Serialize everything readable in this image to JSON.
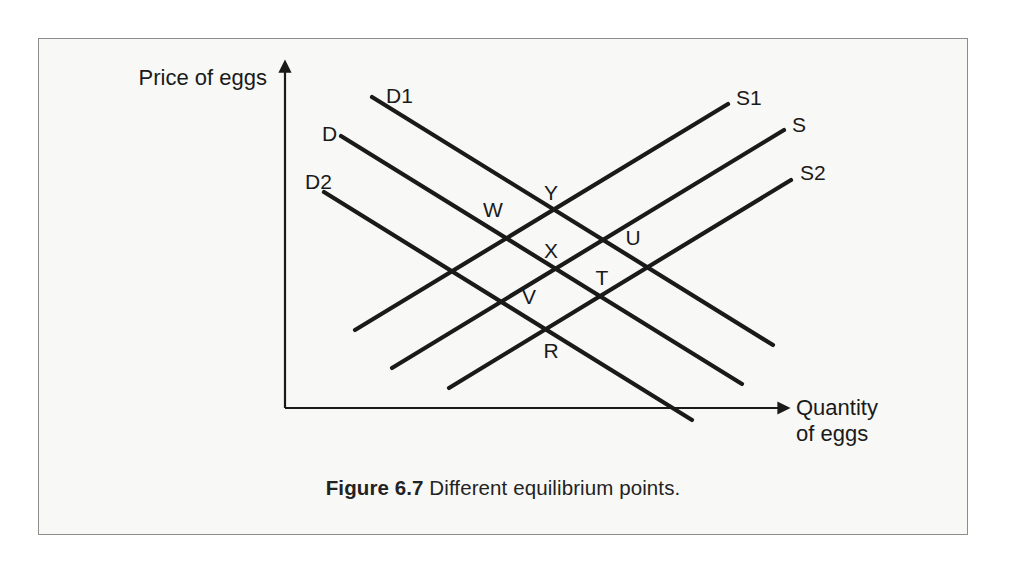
{
  "figure": {
    "caption_label": "Figure 6.7",
    "caption_text": "Different equilibrium points.",
    "frame_color": "#8d8d8d",
    "background_color": "#f8f8f6",
    "line_color": "#1a1a1a"
  },
  "axes": {
    "y_axis_label_line1": "Price of eggs",
    "x_axis_label_line1": "Quantity",
    "x_axis_label_line2": "of eggs",
    "origin": [
      285,
      408
    ],
    "y_axis_top": [
      285,
      70
    ],
    "x_axis_right": [
      780,
      408
    ]
  },
  "chart_data": {
    "type": "line",
    "title": "Different equilibrium points.",
    "xlabel": "Quantity of eggs",
    "ylabel": "Price of eggs",
    "grid": false,
    "legend": "inline-curve-labels",
    "axis_style": "arrow-headed, unscaled schematic axes (no tick marks, no numeric ticks)",
    "series": [
      {
        "name": "D1",
        "role": "demand",
        "slope": "negative",
        "label": "D1",
        "label_pos": [
          386,
          97
        ],
        "start": [
          372,
          97
        ],
        "end": [
          773,
          345
        ]
      },
      {
        "name": "D",
        "role": "demand",
        "slope": "negative",
        "label": "D",
        "label_pos": [
          322,
          135
        ],
        "start": [
          341,
          136
        ],
        "end": [
          742,
          384
        ]
      },
      {
        "name": "D2",
        "role": "demand",
        "slope": "negative",
        "label": "D2",
        "label_pos": [
          305,
          183
        ],
        "start": [
          324,
          192
        ],
        "end": [
          692,
          420
        ]
      },
      {
        "name": "S1",
        "role": "supply",
        "slope": "positive",
        "label": "S1",
        "label_pos": [
          736,
          99
        ],
        "start": [
          355,
          330
        ],
        "end": [
          728,
          104
        ]
      },
      {
        "name": "S",
        "role": "supply",
        "slope": "positive",
        "label": "S",
        "label_pos": [
          792,
          126
        ],
        "start": [
          392,
          368
        ],
        "end": [
          784,
          130
        ]
      },
      {
        "name": "S2",
        "role": "supply",
        "slope": "positive",
        "label": "S2",
        "label_pos": [
          800,
          174
        ],
        "start": [
          449,
          388
        ],
        "end": [
          791,
          180
        ]
      }
    ],
    "equilibrium_points": [
      {
        "label": "Y",
        "curves": [
          "D1",
          "S1"
        ],
        "point": [
          558,
          212
        ],
        "label_pos": [
          551,
          194
        ]
      },
      {
        "label": "W",
        "curves": [
          "D",
          "S1"
        ],
        "point": [
          500,
          248
        ],
        "label_pos": [
          493,
          211
        ]
      },
      {
        "label": "X",
        "curves": [
          "D1",
          "S"
        ],
        "point": [
          556,
          271
        ],
        "label_pos": [
          551,
          252
        ]
      },
      {
        "label": "U",
        "curves": [
          "D1",
          "S2"
        ],
        "point": [
          621,
          252
        ],
        "label_pos": [
          633,
          239
        ]
      },
      {
        "label": "T",
        "curves": [
          "D",
          "S2"
        ],
        "point": [
          620,
          308
        ],
        "label_pos": [
          602,
          279
        ]
      },
      {
        "label": "V",
        "curves": [
          "D2",
          "S1"
        ],
        "point": [
          496,
          306
        ],
        "label_pos": [
          529,
          298
        ]
      },
      {
        "label": "R",
        "curves": [
          "D2",
          "S"
        ],
        "point": [
          553,
          328
        ],
        "label_pos": [
          551,
          352
        ]
      }
    ],
    "point_labels": [
      "Y",
      "W",
      "X",
      "U",
      "T",
      "V",
      "R"
    ]
  }
}
